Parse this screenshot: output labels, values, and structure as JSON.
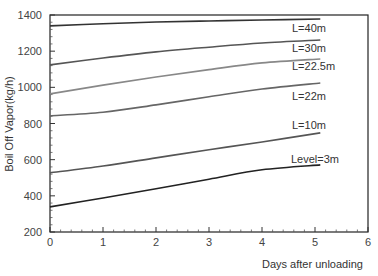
{
  "chart_data": {
    "type": "line",
    "title": "",
    "xlabel": "Days after unloading",
    "ylabel": "Boil Off Vapor(kg/h)",
    "xlim": [
      0,
      6
    ],
    "ylim": [
      200,
      1400
    ],
    "xticks": [
      0,
      1,
      2,
      3,
      4,
      5,
      6
    ],
    "yticks": [
      200,
      400,
      600,
      800,
      1000,
      1200,
      1400
    ],
    "grid": false,
    "legend": "inline labels at line ends",
    "x": [
      0,
      1,
      2,
      3,
      4,
      5.1
    ],
    "series": [
      {
        "name": "L=40m",
        "color": "#333333",
        "values": [
          1340,
          1352,
          1361,
          1367,
          1372,
          1378
        ]
      },
      {
        "name": "L=30m",
        "color": "#555555",
        "values": [
          1124,
          1162,
          1196,
          1222,
          1245,
          1262
        ]
      },
      {
        "name": "L=22.5m",
        "color": "#888888",
        "values": [
          964,
          1012,
          1057,
          1098,
          1135,
          1157
        ]
      },
      {
        "name": "L=22m",
        "color": "#666666",
        "values": [
          842,
          862,
          903,
          948,
          991,
          1024
        ]
      },
      {
        "name": "L=10m",
        "color": "#555555",
        "values": [
          527,
          565,
          610,
          655,
          698,
          748
        ]
      },
      {
        "name": "Level=3m",
        "color": "#222222",
        "values": [
          339,
          388,
          439,
          492,
          544,
          571
        ]
      }
    ]
  }
}
